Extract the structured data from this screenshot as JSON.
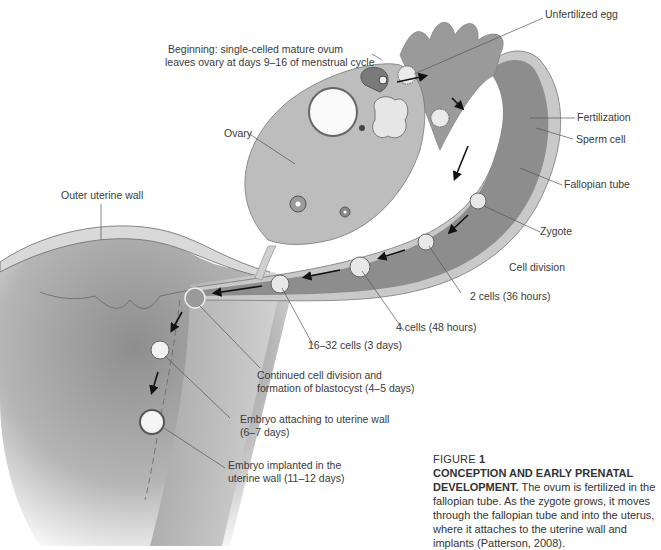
{
  "labels": {
    "beginning_line1": "Beginning: single-celled mature ovum",
    "beginning_line2": "leaves ovary at days 9–16 of menstrual cycle",
    "unfertilized_egg": "Unfertilized egg",
    "fertilization": "Fertilization",
    "sperm_cell": "Sperm cell",
    "fallopian_tube": "Fallopian tube",
    "ovary": "Ovary",
    "outer_uterine_wall": "Outer uterine wall",
    "zygote": "Zygote",
    "cell_division": "Cell division",
    "two_cells": "2 cells (36 hours)",
    "four_cells": "4 cells (48 hours)",
    "sixteen_cells": "16–32 cells (3 days)",
    "blastocyst_line1": "Continued cell division and",
    "blastocyst_line2": "formation of blastocyst (4–5 days)",
    "attaching_line1": "Embryo attaching to uterine wall",
    "attaching_line2": "(6–7 days)",
    "implanted_line1": "Embryo implanted in the",
    "implanted_line2": "uterine wall (11–12 days)"
  },
  "caption": {
    "figure_word": "FIGURE",
    "figure_number": "1",
    "title": "CONCEPTION AND EARLY PRENATAL DEVELOPMENT.",
    "body": " The ovum is fertilized in the fallopian tube. As the zygote grows, it moves through the fallopian tube and into the uterus, where it attaches to the uterine wall and implants (Patterson, 2008)."
  },
  "colors": {
    "tube_fill": "#8a8a8a",
    "tube_outer": "#c8c8c8",
    "ovary_fill": "#bdbdbd",
    "uterus_fill": "#9a9a9a",
    "line": "#555555",
    "text": "#333333"
  }
}
